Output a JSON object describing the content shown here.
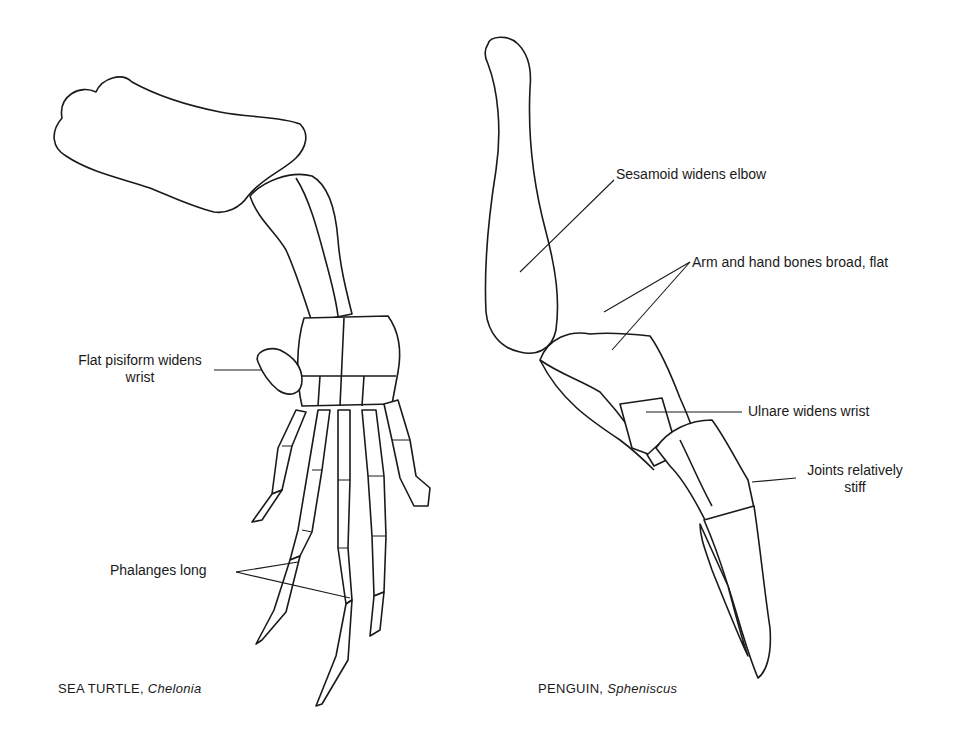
{
  "figure": {
    "left_panel": {
      "caption_common": "SEA TURTLE,",
      "caption_genus": "Chelonia",
      "labels": {
        "pisiform_line1": "Flat pisiform widens",
        "pisiform_line2": "wrist",
        "phalanges": "Phalanges long"
      }
    },
    "right_panel": {
      "caption_common": "PENGUIN,",
      "caption_genus": "Spheniscus",
      "labels": {
        "sesamoid": "Sesamoid widens elbow",
        "arm_hand": "Arm and hand bones broad, flat",
        "ulnare": "Ulnare widens wrist",
        "joints_line1": "Joints relatively",
        "joints_line2": "stiff"
      }
    }
  }
}
